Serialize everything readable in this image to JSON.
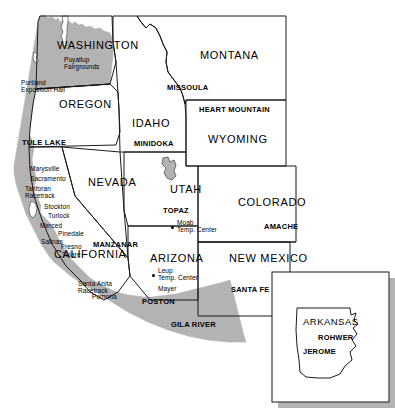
{
  "map": {
    "title": "Japanese American Exclusion Zone and Relocation Centers",
    "colors": {
      "exclusion_zone_fill": "#b3b3b3",
      "state_fill": "#ffffff",
      "border_stroke": "#1a1a1a",
      "inset_shadow": "#b3b3b3",
      "background": "#ffffff"
    },
    "states": [
      {
        "id": "washington",
        "label": "WASHINGTON",
        "x": 57,
        "y": 47,
        "class": "state-name"
      },
      {
        "id": "oregon",
        "label": "OREGON",
        "x": 59,
        "y": 105,
        "class": "state-name"
      },
      {
        "id": "montana",
        "label": "MONTANA",
        "x": 200,
        "y": 56,
        "class": "state-name"
      },
      {
        "id": "idaho",
        "label": "IDAHO",
        "x": 132,
        "y": 124,
        "class": "state-name"
      },
      {
        "id": "wyoming",
        "label": "WYOMING",
        "x": 208,
        "y": 140,
        "class": "state-name"
      },
      {
        "id": "nevada",
        "label": "NEVADA",
        "x": 88,
        "y": 183,
        "class": "state-name"
      },
      {
        "id": "utah",
        "label": "UTAH",
        "x": 170,
        "y": 190,
        "class": "state-name"
      },
      {
        "id": "colorado",
        "label": "COLORADO",
        "x": 238,
        "y": 203,
        "class": "state-name"
      },
      {
        "id": "california",
        "label": "CALIFORNIA",
        "x": 54,
        "y": 255,
        "class": "state-name"
      },
      {
        "id": "arizona",
        "label": "ARIZONA",
        "x": 150,
        "y": 259,
        "class": "state-name"
      },
      {
        "id": "new-mexico",
        "label": "NEW MEXICO",
        "x": 229,
        "y": 259,
        "class": "state-name"
      },
      {
        "id": "arkansas",
        "label": "ARKANSAS",
        "x": 303,
        "y": 323,
        "class": "state-name-sm"
      }
    ],
    "relocation_centers": [
      {
        "id": "tule-lake",
        "label": "TULE LAKE",
        "x": 22,
        "y": 143
      },
      {
        "id": "minidoka",
        "label": "MINIDOKA",
        "x": 134,
        "y": 144
      },
      {
        "id": "heart-mountain",
        "label": "HEART MOUNTAIN",
        "x": 199,
        "y": 110
      },
      {
        "id": "topaz",
        "label": "TOPAZ",
        "x": 163,
        "y": 211
      },
      {
        "id": "amache",
        "label": "AMACHE",
        "x": 264,
        "y": 227
      },
      {
        "id": "manzanar",
        "label": "MANZANAR",
        "x": 93,
        "y": 245
      },
      {
        "id": "poston",
        "label": "POSTON",
        "x": 142,
        "y": 302
      },
      {
        "id": "gila-river",
        "label": "GILA RIVER",
        "x": 171,
        "y": 325
      },
      {
        "id": "santa-fe",
        "label": "SANTA FE",
        "x": 231,
        "y": 290
      },
      {
        "id": "rohwer",
        "label": "ROHWER",
        "x": 318,
        "y": 338
      },
      {
        "id": "jerome",
        "label": "JEROME",
        "x": 303,
        "y": 352
      },
      {
        "id": "missoula",
        "label": "MISSOULA",
        "x": 167,
        "y": 88
      }
    ],
    "assembly_centers": [
      {
        "id": "puyallup-fairgrounds",
        "label": "Puyallup\nFairgrounds",
        "x": 64,
        "y": 61
      },
      {
        "id": "portland-exposition-hall",
        "label": "Portland\nExposition Hall",
        "x": 21,
        "y": 84
      },
      {
        "id": "marysville",
        "label": "Marysville",
        "x": 30,
        "y": 170
      },
      {
        "id": "sacramento",
        "label": "Sacramento",
        "x": 30,
        "y": 180
      },
      {
        "id": "tanforan-racetrack",
        "label": "Tanforan\nRacetrack",
        "x": 25,
        "y": 190
      },
      {
        "id": "stockton",
        "label": "Stockton",
        "x": 44,
        "y": 208
      },
      {
        "id": "turlock",
        "label": "Turlock",
        "x": 48,
        "y": 217
      },
      {
        "id": "merced",
        "label": "Merced",
        "x": 40,
        "y": 227
      },
      {
        "id": "pinedale",
        "label": "Pinedale",
        "x": 58,
        "y": 235
      },
      {
        "id": "salinas",
        "label": "Salinas",
        "x": 41,
        "y": 243
      },
      {
        "id": "fresno",
        "label": "Fresno",
        "x": 61,
        "y": 248
      },
      {
        "id": "tulare",
        "label": "Tulare",
        "x": 62,
        "y": 256
      },
      {
        "id": "santa-anita-racetrack",
        "label": "Santa Anita\nRacetrack",
        "x": 78,
        "y": 285
      },
      {
        "id": "pomona",
        "label": "Pomona",
        "x": 92,
        "y": 298
      }
    ],
    "temp_centers": [
      {
        "id": "moab-temp-center",
        "label": "Moab\nTemp. Center",
        "x": 177,
        "y": 224,
        "dot_x": 171,
        "dot_y": 226
      },
      {
        "id": "leupp-temp-center",
        "label": "Leup\nTemp. Center",
        "x": 158,
        "y": 272,
        "dot_x": 152,
        "dot_y": 274
      },
      {
        "id": "mayer",
        "label": "Mayer",
        "x": 158,
        "y": 290
      }
    ],
    "inset": {
      "id": "arkansas-inset",
      "label": "Arkansas inset",
      "x": 272,
      "y": 272,
      "width": 117,
      "height": 130
    }
  }
}
